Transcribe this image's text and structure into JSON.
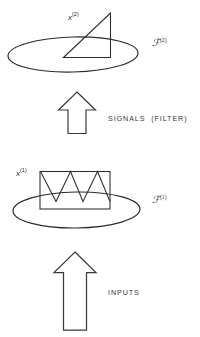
{
  "figure": {
    "background_color": "#ffffff",
    "stroke_color": "#2b2b2b"
  },
  "upper_group": {
    "set_label": "ℱ",
    "set_superscript": "(2)",
    "signal_label": "x",
    "signal_superscript": "(2)",
    "signal_shape": "right-triangle-waveform"
  },
  "lower_group": {
    "set_label": "ℱ",
    "set_superscript": "(1)",
    "signal_label": "x",
    "signal_superscript": "(1)",
    "signal_shape": "sawtooth-waveform-in-rectangle"
  },
  "arrows": {
    "upper": {
      "direction": "up",
      "caption": "SIGNALS  (FILTER)"
    },
    "lower": {
      "direction": "up",
      "caption": "INPUTS"
    }
  }
}
